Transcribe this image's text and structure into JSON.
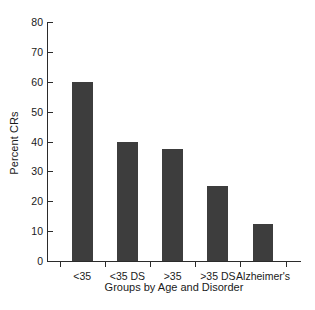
{
  "chart_data": {
    "type": "bar",
    "title": "",
    "xlabel": "Groups by Age and Disorder",
    "ylabel": "Percent CRs",
    "categories": [
      "<35",
      "<35 DS",
      ">35",
      ">35 DS",
      "Alzheimer's"
    ],
    "values": [
      60,
      40,
      37.5,
      25,
      12.5
    ],
    "ylim": [
      0,
      80
    ],
    "ytick_values": [
      0,
      10,
      20,
      30,
      40,
      50,
      60,
      70,
      80
    ],
    "ytick_labels": [
      "0",
      "10",
      "20",
      "30",
      "40",
      "50",
      "60",
      "70",
      "80"
    ],
    "grid": false,
    "legend": false,
    "bar_color": "#3d3d3d",
    "axis_color": "#2b2b2b",
    "background_color": "#ffffff"
  }
}
